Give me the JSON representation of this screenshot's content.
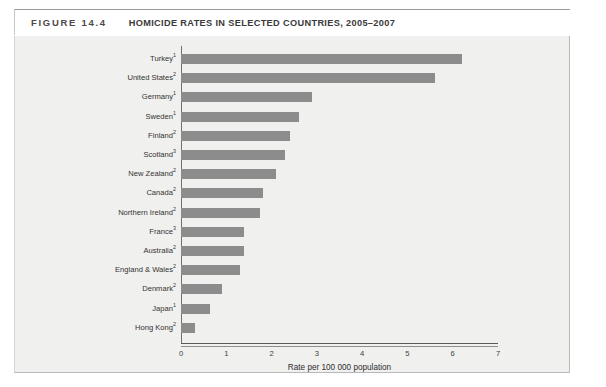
{
  "figure": {
    "number": "FIGURE 14.4",
    "title": "HOMICIDE RATES IN SELECTED COUNTRIES, 2005–2007"
  },
  "chart_data": {
    "type": "bar",
    "orientation": "horizontal",
    "title": "HOMICIDE RATES IN SELECTED COUNTRIES, 2005–2007",
    "xlabel": "Rate per 100 000 population",
    "ylabel": "",
    "xlim": [
      0,
      7
    ],
    "xticks": [
      0,
      1,
      2,
      3,
      4,
      5,
      6,
      7
    ],
    "xtick_labels": [
      "0",
      "1",
      "2",
      "3",
      "4",
      "5",
      "6",
      "7"
    ],
    "grid": false,
    "legend": false,
    "bar_color": "#8c8c8c",
    "background_color": "#f0f0ee",
    "categories": [
      "Turkey",
      "United States",
      "Germany",
      "Sweden",
      "Finland",
      "Scotland",
      "New Zealand",
      "Canada",
      "Northern Ireland",
      "France",
      "Australia",
      "England & Wales",
      "Denmark",
      "Japan",
      "Hong Kong"
    ],
    "category_footnotes": [
      "1",
      "2",
      "1",
      "1",
      "2",
      "3",
      "2",
      "2",
      "2",
      "3",
      "2",
      "2",
      "2",
      "1",
      "2"
    ],
    "values": [
      6.2,
      5.6,
      2.9,
      2.6,
      2.4,
      2.3,
      2.1,
      1.8,
      1.75,
      1.4,
      1.4,
      1.3,
      0.9,
      0.65,
      0.3
    ]
  }
}
